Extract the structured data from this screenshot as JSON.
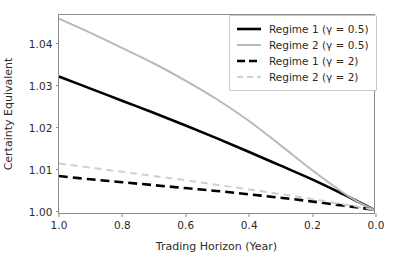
{
  "chart_data": {
    "type": "line",
    "title": "",
    "xlabel": "Trading Horizon (Year)",
    "ylabel": "Certainty Equivalent",
    "xlim": [
      1.0,
      0.0
    ],
    "ylim": [
      0.9992,
      1.0468
    ],
    "x_inverted": true,
    "grid": false,
    "legend_position": "upper right",
    "xticks": [
      "1.0",
      "0.8",
      "0.6",
      "0.4",
      "0.2",
      "0.0"
    ],
    "xtick_values": [
      1.0,
      0.8,
      0.6,
      0.4,
      0.2,
      0.0
    ],
    "yticks": [
      "1.00",
      "1.01",
      "1.02",
      "1.03",
      "1.04"
    ],
    "ytick_values": [
      1.0,
      1.01,
      1.02,
      1.03,
      1.04
    ],
    "x": [
      1.0,
      0.9,
      0.8,
      0.7,
      0.6,
      0.5,
      0.4,
      0.3,
      0.2,
      0.1,
      0.05,
      0.0
    ],
    "series": [
      {
        "name": "Regime 1 (γ = 0.5)",
        "color": "#000000",
        "style": "solid",
        "width": 2.6,
        "values": [
          1.032,
          1.0291,
          1.0262,
          1.0233,
          1.0203,
          1.0172,
          1.014,
          1.0107,
          1.0074,
          1.0038,
          1.0019,
          1.0
        ]
      },
      {
        "name": "Regime 2 (γ = 0.5)",
        "color": "#b9b9b9",
        "style": "solid",
        "width": 2.0,
        "values": [
          1.0459,
          1.0425,
          1.0389,
          1.0352,
          1.0311,
          1.0266,
          1.0215,
          1.0157,
          1.0097,
          1.0042,
          1.0019,
          1.0
        ]
      },
      {
        "name": "Regime 1 (γ = 2)",
        "color": "#000000",
        "style": "dashed",
        "width": 2.6,
        "values": [
          1.0081,
          1.0073,
          1.0066,
          1.0059,
          1.0052,
          1.0045,
          1.0037,
          1.0029,
          1.002,
          1.001,
          1.0005,
          1.0
        ]
      },
      {
        "name": "Regime 2 (γ = 2)",
        "color": "#cfcfcf",
        "style": "dashed",
        "width": 2.0,
        "values": [
          1.0111,
          1.0101,
          1.0091,
          1.0081,
          1.0071,
          1.006,
          1.0049,
          1.0038,
          1.0026,
          1.0013,
          1.0007,
          1.0
        ]
      }
    ]
  },
  "legend": {
    "items": [
      {
        "label": "Regime 1 (γ = 0.5)"
      },
      {
        "label": "Regime 2 (γ = 0.5)"
      },
      {
        "label": "Regime 1 (γ = 2)"
      },
      {
        "label": "Regime 2 (γ = 2)"
      }
    ]
  },
  "axes": {
    "x_label": "Trading Horizon (Year)",
    "y_label": "Certainty Equivalent",
    "x_tick_labels": [
      "1.0",
      "0.8",
      "0.6",
      "0.4",
      "0.2",
      "0.0"
    ],
    "y_tick_labels": [
      "1.00",
      "1.01",
      "1.02",
      "1.03",
      "1.04"
    ]
  },
  "colors": {
    "background": "#ffffff",
    "axis": "#8d8d8d",
    "text": "#2b2b2b",
    "series_dark": "#000000",
    "series_light": "#b9b9b9",
    "series_lighter": "#cfcfcf",
    "legend_border": "#c8c8c8"
  }
}
